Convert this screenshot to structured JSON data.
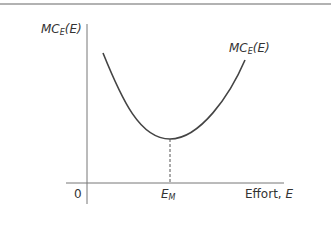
{
  "diagram": {
    "type": "cost curve",
    "colors": {
      "frame": "#999999",
      "axis": "#777777",
      "curve": "#444444",
      "text": "#333333"
    },
    "y_axis_label": {
      "main": "MC",
      "sub": "E",
      "arg": "(E)"
    },
    "curve_label": {
      "main": "MC",
      "sub": "E",
      "arg": "(E)"
    },
    "origin_label": "0",
    "x_axis_label": {
      "text": "Effort, ",
      "var": "E"
    },
    "min_marker_label": {
      "main": "E",
      "sub": "M"
    },
    "curve_shape": "U-shaped marginal cost curve with minimum at E_M",
    "min_line_style": "dashed"
  }
}
